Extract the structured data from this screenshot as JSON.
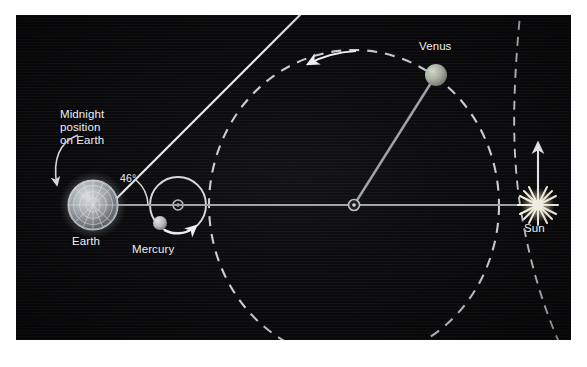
{
  "figure": {
    "type": "astronomy-orbit-diagram",
    "background_color": "#0a0a0c",
    "line_color": "#d8dade",
    "text_color": "#eef0f2"
  },
  "labels": {
    "midnight_line1": "Midnight",
    "midnight_line2": "position",
    "midnight_line3": "on Earth",
    "earth": "Earth",
    "mercury": "Mercury",
    "venus": "Venus",
    "sun": "Sun",
    "angle": "46°"
  },
  "bodies": [
    {
      "name": "Earth",
      "label": "Earth",
      "x": 77,
      "y": 190,
      "radius": 27,
      "color": "#a9aeb3",
      "style": "textured-globe-with-halo"
    },
    {
      "name": "Mercury",
      "label": "Mercury",
      "x": 144,
      "y": 208,
      "radius": 7,
      "color": "#b9bcbe",
      "style": "solid-sphere"
    },
    {
      "name": "Venus",
      "label": "Venus",
      "x": 420,
      "y": 60,
      "radius": 11,
      "color": "#aeb4a8",
      "style": "solid-sphere"
    },
    {
      "name": "Sun",
      "label": "Sun",
      "x": 522,
      "y": 190,
      "radius": 9,
      "color": "#fdf6d8",
      "style": "starburst"
    }
  ],
  "orbits": [
    {
      "name": "mercury-orbit",
      "style": "solid",
      "shape": "circle",
      "cx": 162,
      "cy": 190,
      "r": 28,
      "color": "#d8dade"
    },
    {
      "name": "venus-orbit",
      "style": "dashed",
      "shape": "ellipse",
      "cx": 338,
      "cy": 190,
      "rx": 145,
      "ry": 155,
      "color": "#d8dade"
    },
    {
      "name": "earth-orbit",
      "style": "dashed",
      "shape": "arc",
      "note": "outer dashed arc passing just left of the Sun",
      "color": "#d8dade"
    }
  ],
  "lines": [
    {
      "name": "earth-sun-axis",
      "from": "Earth",
      "to": "Sun",
      "style": "solid",
      "color": "#9ea2a6"
    },
    {
      "name": "venus-radius",
      "from": "orbit-center",
      "to": "Venus",
      "style": "solid",
      "color": "#9ea2a6"
    },
    {
      "name": "line-of-sight-to-venus",
      "from": "Earth",
      "to": "tangent-point",
      "style": "solid",
      "color": "#e6e8ea"
    }
  ],
  "annotations": {
    "angle_value": "46°",
    "angle_meaning": "greatest elongation angle between the Earth-Sun line and the Earth-Venus line of sight",
    "venus_direction_arrow": "counterclockwise along orbit",
    "mercury_direction_arrow": "counterclockwise along orbit",
    "sun_up_arrow": "motion arrow above the Sun",
    "midnight_pointer": "curved leader arrow to the left limb of Earth"
  }
}
